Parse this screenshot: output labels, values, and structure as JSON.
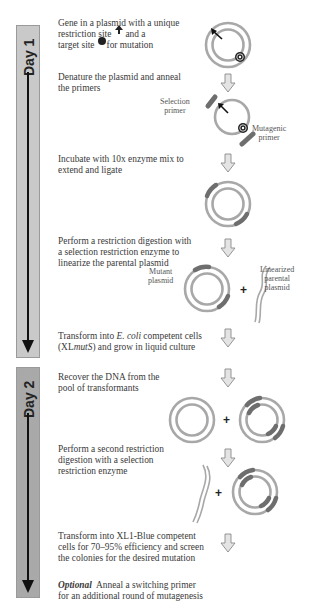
{
  "phases": [
    {
      "label": "Day 1"
    },
    {
      "label": "Day 2"
    }
  ],
  "steps": [
    {
      "lines": [
        "Gene in a plasmid with a unique",
        "restriction site",
        "and a",
        "target site",
        "for mutation"
      ]
    },
    {
      "lines": [
        "Denature the plasmid and anneal",
        "the primers"
      ]
    },
    {
      "lines": [
        "Incubate with 10x enzyme mix to",
        "extend and ligate"
      ]
    },
    {
      "lines": [
        "Perform a restriction digestion with",
        "a selection restriction enzyme to",
        "linearize the parental plasmid"
      ]
    },
    {
      "lines": [
        "Transform into",
        "E. coli",
        "competent cells",
        "(XL",
        "mutS",
        ") and grow in liquid culture"
      ]
    },
    {
      "lines": [
        "Recover the DNA from the",
        "pool of transformants"
      ]
    },
    {
      "lines": [
        "Perform a second restriction",
        "digestion with a selection",
        "restriction enzyme"
      ]
    },
    {
      "lines": [
        "Transform into XL1-Blue competent",
        "cells for 70–95% efficiency and screen",
        "the colonies for the desired mutation"
      ]
    },
    {
      "prefix": "Optional",
      "lines": [
        "Anneal a switching primer",
        "for an additional round of mutagenesis"
      ]
    }
  ],
  "labels": {
    "selection_primer": [
      "Selection",
      "primer"
    ],
    "mutagenic_primer": [
      "Mutagenic",
      "primer"
    ],
    "mutant_plasmid": [
      "Mutant",
      "plasmid"
    ],
    "linearized_parental": [
      "Linearized",
      "parental",
      "plasmid"
    ],
    "plus": "+"
  },
  "colors": {
    "ring": "#a8a8a8",
    "primer": "#6e6e6e",
    "arrow_fill": "#e4e4e4",
    "day1_bar": "#c9c9c9",
    "day2_bar": "#a9a9a9"
  }
}
